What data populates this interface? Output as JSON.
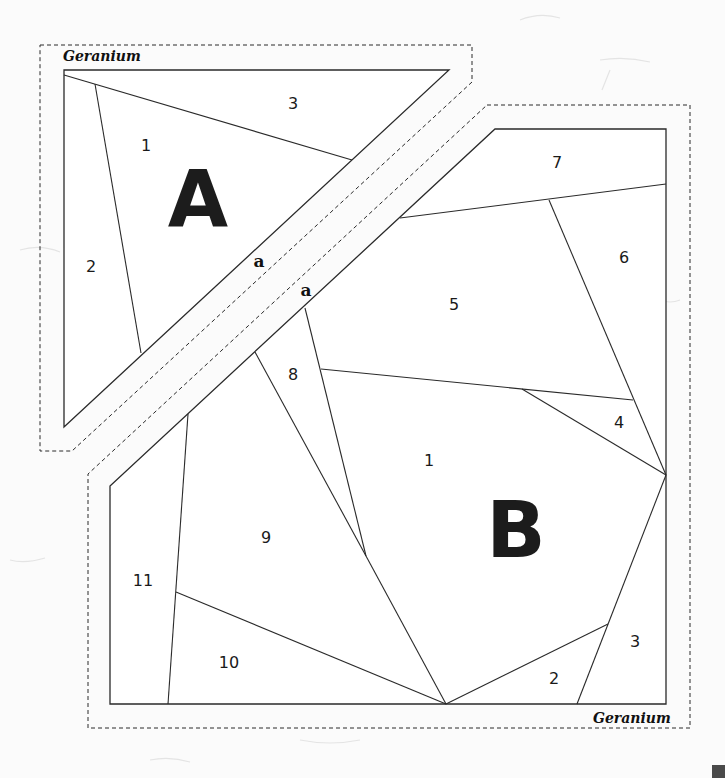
{
  "pattern": {
    "name": "Geranium",
    "section_a": {
      "label": "A",
      "name_label": "Geranium",
      "join_mark": "a",
      "pieces": [
        {
          "id": "1",
          "label": "1"
        },
        {
          "id": "2",
          "label": "2"
        },
        {
          "id": "3",
          "label": "3"
        }
      ]
    },
    "section_b": {
      "label": "B",
      "name_label": "Geranium",
      "join_mark": "a",
      "pieces": [
        {
          "id": "1",
          "label": "1"
        },
        {
          "id": "2",
          "label": "2"
        },
        {
          "id": "3",
          "label": "3"
        },
        {
          "id": "4",
          "label": "4"
        },
        {
          "id": "5",
          "label": "5"
        },
        {
          "id": "6",
          "label": "6"
        },
        {
          "id": "7",
          "label": "7"
        },
        {
          "id": "8",
          "label": "8"
        },
        {
          "id": "9",
          "label": "9"
        },
        {
          "id": "10",
          "label": "10"
        },
        {
          "id": "11",
          "label": "11"
        }
      ]
    },
    "colors": {
      "line": "#2a2a2a",
      "background": "#fbfbfb",
      "letter": "#1c1c1c"
    }
  }
}
